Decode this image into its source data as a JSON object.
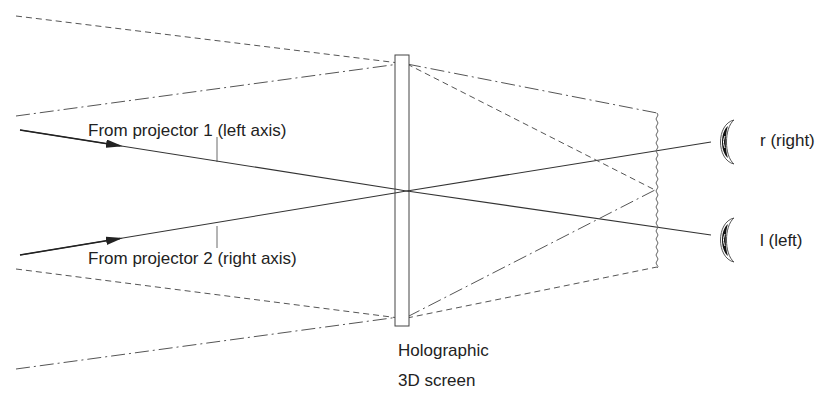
{
  "diagram": {
    "labels": {
      "projector1": "From projector 1 (left axis)",
      "projector2": "From projector 2 (right axis)",
      "eye_right": "r (right)",
      "eye_left": "l (left)",
      "screen_line1": "Holographic",
      "screen_line2": "3D screen"
    },
    "colors": {
      "line": "#333333",
      "dashed": "#555555",
      "text": "#222222",
      "background": "#ffffff"
    }
  }
}
